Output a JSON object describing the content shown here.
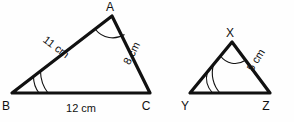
{
  "figure": {
    "background_color": "#fefefe",
    "stroke_color": "#111111"
  },
  "triangles": [
    {
      "id": "abc",
      "vertices": [
        {
          "name": "A",
          "label": "A",
          "x": 112,
          "y": 16,
          "label_x": 110,
          "label_y": 11
        },
        {
          "name": "B",
          "label": "B",
          "x": 12,
          "y": 93,
          "label_x": 6,
          "label_y": 110
        },
        {
          "name": "C",
          "label": "C",
          "x": 150,
          "y": 93,
          "label_x": 146,
          "label_y": 110
        }
      ],
      "sides": [
        {
          "from": "A",
          "to": "B",
          "label": "11 cm",
          "label_x": 54,
          "label_y": 50,
          "rotation": 37
        },
        {
          "from": "A",
          "to": "C",
          "label": "8 cm",
          "label_x": 135,
          "label_y": 55,
          "rotation": -63
        },
        {
          "from": "B",
          "to": "C",
          "label": "12 cm",
          "label_x": 81,
          "label_y": 112,
          "rotation": 0
        }
      ],
      "angle_marks": [
        {
          "vertex": "A",
          "arcs": 1
        },
        {
          "vertex": "B",
          "arcs": 2
        }
      ]
    },
    {
      "id": "xyz",
      "vertices": [
        {
          "name": "X",
          "label": "X",
          "x": 232,
          "y": 42,
          "label_x": 230,
          "label_y": 37
        },
        {
          "name": "Y",
          "label": "Y",
          "x": 190,
          "y": 93,
          "label_x": 185,
          "label_y": 110
        },
        {
          "name": "Z",
          "label": "Z",
          "x": 270,
          "y": 93,
          "label_x": 266,
          "label_y": 110
        }
      ],
      "sides": [
        {
          "from": "X",
          "to": "Z",
          "label": "5 cm",
          "label_x": 259,
          "label_y": 62,
          "rotation": -58
        }
      ],
      "angle_marks": [
        {
          "vertex": "X",
          "arcs": 1
        },
        {
          "vertex": "Y",
          "arcs": 2
        }
      ]
    }
  ]
}
